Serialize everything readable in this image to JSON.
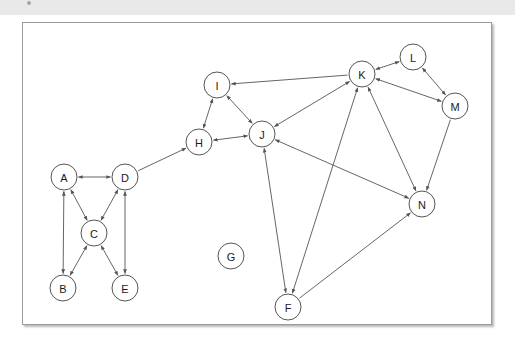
{
  "caption": {
    "bullet_icon": "bullet-point-icon",
    "text": "                                                                                                                                "
  },
  "figure": {
    "title": "",
    "background_color": "#ffffff",
    "border_color": "#9a9a9a",
    "node_fill": "#ffffff",
    "node_stroke": "#555555",
    "edge_color": "#555555",
    "label_color": "#1a1a1a"
  },
  "chart_data": {
    "type": "diagram",
    "subtype": "directed-graph",
    "title": "",
    "xlabel": "",
    "ylabel": "",
    "node_radius": 13,
    "view_box": [
      0,
      0,
      470,
      303
    ],
    "nodes": [
      {
        "id": "A",
        "label": "A",
        "x": 41,
        "y": 154
      },
      {
        "id": "B",
        "label": "B",
        "x": 40,
        "y": 265
      },
      {
        "id": "C",
        "label": "C",
        "x": 71,
        "y": 210
      },
      {
        "id": "D",
        "label": "D",
        "x": 102,
        "y": 154
      },
      {
        "id": "E",
        "label": "E",
        "x": 102,
        "y": 265
      },
      {
        "id": "F",
        "label": "F",
        "x": 265,
        "y": 284
      },
      {
        "id": "G",
        "label": "G",
        "x": 208,
        "y": 233
      },
      {
        "id": "H",
        "label": "H",
        "x": 176,
        "y": 119
      },
      {
        "id": "I",
        "label": "I",
        "x": 194,
        "y": 62
      },
      {
        "id": "J",
        "label": "J",
        "x": 239,
        "y": 111
      },
      {
        "id": "K",
        "label": "K",
        "x": 339,
        "y": 51
      },
      {
        "id": "L",
        "label": "L",
        "x": 390,
        "y": 34
      },
      {
        "id": "M",
        "label": "M",
        "x": 432,
        "y": 83
      },
      {
        "id": "N",
        "label": "N",
        "x": 399,
        "y": 181
      }
    ],
    "edges": [
      {
        "source": "A",
        "target": "D",
        "directed": "both"
      },
      {
        "source": "A",
        "target": "C",
        "directed": "both"
      },
      {
        "source": "A",
        "target": "B",
        "directed": "both"
      },
      {
        "source": "C",
        "target": "D",
        "directed": "both"
      },
      {
        "source": "C",
        "target": "B",
        "directed": "both"
      },
      {
        "source": "C",
        "target": "E",
        "directed": "both"
      },
      {
        "source": "D",
        "target": "E",
        "directed": "both"
      },
      {
        "source": "D",
        "target": "H",
        "directed": "forward"
      },
      {
        "source": "H",
        "target": "I",
        "directed": "both"
      },
      {
        "source": "H",
        "target": "J",
        "directed": "both"
      },
      {
        "source": "I",
        "target": "J",
        "directed": "both"
      },
      {
        "source": "K",
        "target": "I",
        "directed": "forward"
      },
      {
        "source": "J",
        "target": "K",
        "directed": "both"
      },
      {
        "source": "J",
        "target": "N",
        "directed": "both"
      },
      {
        "source": "J",
        "target": "F",
        "directed": "both"
      },
      {
        "source": "F",
        "target": "K",
        "directed": "both"
      },
      {
        "source": "F",
        "target": "N",
        "directed": "forward"
      },
      {
        "source": "K",
        "target": "L",
        "directed": "both"
      },
      {
        "source": "K",
        "target": "M",
        "directed": "both"
      },
      {
        "source": "K",
        "target": "N",
        "directed": "both"
      },
      {
        "source": "L",
        "target": "M",
        "directed": "both"
      },
      {
        "source": "M",
        "target": "N",
        "directed": "forward"
      }
    ],
    "isolated_nodes": [
      "G"
    ],
    "legend": [],
    "annotations": []
  }
}
